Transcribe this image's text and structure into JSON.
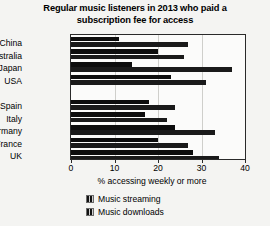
{
  "chart_data": {
    "type": "bar",
    "orientation": "horizontal",
    "title": "Regular music listeners in 2013 who paid a subscription fee for access",
    "xlabel": "% accessing weekly or more",
    "ylabel": "",
    "xlim": [
      0,
      40
    ],
    "xticks": [
      0,
      10,
      20,
      30,
      40
    ],
    "grid": true,
    "legend_position": "bottom",
    "categories": [
      "China",
      "Australia",
      "Japan",
      "USA",
      "",
      "Spain",
      "Italy",
      "Germany",
      "France",
      "UK"
    ],
    "series": [
      {
        "name": "Music streaming",
        "values": [
          11,
          20,
          14,
          23,
          null,
          18,
          17,
          24,
          20,
          28
        ]
      },
      {
        "name": "Music downloads",
        "values": [
          27,
          26,
          37,
          31,
          null,
          24,
          22,
          33,
          27,
          34
        ]
      }
    ]
  },
  "title": {
    "line1": "Regular music listeners in 2013 who paid a",
    "line2": "subscription fee for access"
  },
  "axis": {
    "x_title": "% accessing weekly or more",
    "ticks": [
      {
        "label": "0",
        "value": 0
      },
      {
        "label": "10",
        "value": 10
      },
      {
        "label": "20",
        "value": 20
      },
      {
        "label": "30",
        "value": 30
      },
      {
        "label": "40",
        "value": 40
      }
    ]
  },
  "legend": {
    "items": [
      {
        "label": "Music streaming",
        "swatch": "legend-swatch-streaming"
      },
      {
        "label": "Music downloads",
        "swatch": "legend-swatch-downloads"
      }
    ]
  },
  "colors": {
    "bar_streaming": "#0d0d0d",
    "bar_downloads": "#1a1a1a",
    "axis": "#2a2a2a",
    "grid": "#cfcfcb",
    "background": "#f4f4f2",
    "plot_background": "#fbfbfa"
  }
}
